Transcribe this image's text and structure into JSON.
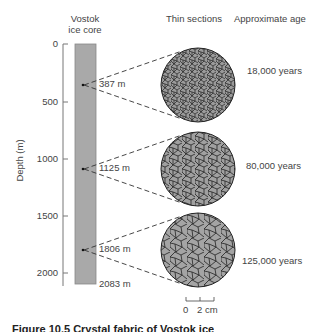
{
  "headers": {
    "core": "Vostok\nice core",
    "core_line1": "Vostok",
    "core_line2": "ice core",
    "thin_sections": "Thin sections",
    "age": "Approximate age"
  },
  "axis": {
    "label": "Depth (m)",
    "ticks": [
      "0",
      "500",
      "1000",
      "1500",
      "2000"
    ]
  },
  "samples": [
    {
      "depth": "387 m",
      "age": "18,000 years"
    },
    {
      "depth": "1125 m",
      "age": "80,000 years"
    },
    {
      "depth": "1806 m",
      "age": "125,000 years"
    }
  ],
  "core_bottom": "2083 m",
  "scale_bar": {
    "zero": "0",
    "label": "2 cm"
  },
  "caption_partial": "Figure 10.5  Crystal fabric of Vostok ice"
}
